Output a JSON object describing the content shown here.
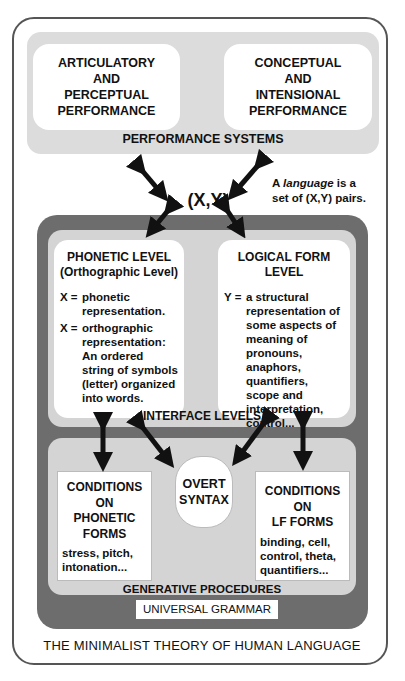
{
  "diagram": {
    "caption": "THE MINIMALIST THEORY OF HUMAN LANGUAGE",
    "performance_systems": {
      "label": "PERFORMANCE SYSTEMS",
      "left_box": [
        "ARTICULATORY",
        "AND",
        "PERCEPTUAL",
        "PERFORMANCE"
      ],
      "right_box": [
        "CONCEPTUAL",
        "AND",
        "INTENSIONAL",
        "PERFORMANCE"
      ]
    },
    "pair": {
      "label": "(X,Y)",
      "note_prefix": "A ",
      "note_em": "language",
      "note_suffix_1": " is a",
      "note_line_2": "set of (X,Y) pairs."
    },
    "interface_levels": {
      "label": "INTERFACE LEVELS",
      "phonetic": {
        "title_1": "PHONETIC LEVEL",
        "title_2": "(Orthographic Level)",
        "defs": [
          {
            "var": "X =",
            "text": "phonetic representation."
          },
          {
            "var": "X =",
            "text": "orthographic representation: An ordered string of symbols (letter) organized into words."
          }
        ]
      },
      "logical_form": {
        "title_1": "LOGICAL FORM",
        "title_2": "LEVEL",
        "defs": [
          {
            "var": "Y =",
            "text": "a structural representation of some aspects of meaning of pronouns, anaphors, quantifiers, scope and interpretation, control..."
          }
        ]
      }
    },
    "generative_procedures": {
      "label": "GENERATIVE PROCEDURES",
      "overt_syntax": [
        "OVERT",
        "SYNTAX"
      ],
      "phonetic_conditions": {
        "title": [
          "CONDITIONS",
          "ON",
          "PHONETIC",
          "FORMS"
        ],
        "examples": "stress, pitch, intonation..."
      },
      "lf_conditions": {
        "title": [
          "CONDITIONS",
          "ON",
          "LF FORMS"
        ],
        "examples": "binding, cell, control, theta, quantifiers..."
      }
    },
    "universal_grammar": "UNIVERSAL GRAMMAR"
  },
  "colors": {
    "outer_border": "#555555",
    "performance_band": "#dcdcdc",
    "dark_container": "#6d6d6d",
    "inner_band": "#d4d4d4",
    "box_fill": "#ffffff",
    "arrow": "#111111"
  }
}
